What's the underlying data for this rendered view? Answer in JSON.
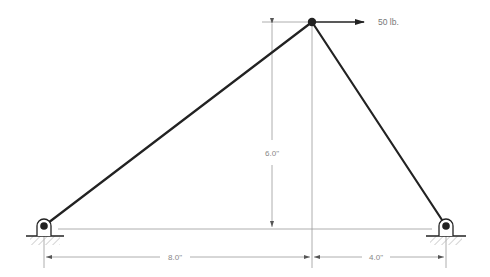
{
  "diagram": {
    "type": "truss",
    "colors": {
      "member": "#222222",
      "dimension": "#999999",
      "hatch": "#aaaaaa",
      "text": "#888888"
    },
    "nodes": [
      {
        "id": "A",
        "label": "left-pin-support",
        "x": 44,
        "y": 226
      },
      {
        "id": "B",
        "label": "apex-joint",
        "x": 312,
        "y": 22
      },
      {
        "id": "C",
        "label": "right-pin-support",
        "x": 446,
        "y": 226
      }
    ],
    "members": [
      {
        "from": "A",
        "to": "B"
      },
      {
        "from": "B",
        "to": "C"
      }
    ],
    "load": {
      "node": "B",
      "direction": "right",
      "magnitude_label": "50 lb."
    },
    "dimensions": {
      "height": "6.0\"",
      "left_span": "8.0\"",
      "right_span": "4.0\""
    }
  }
}
